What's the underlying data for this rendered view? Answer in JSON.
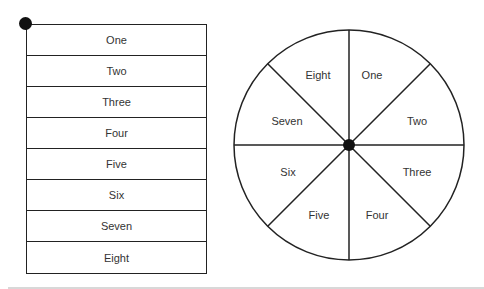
{
  "list": {
    "items": [
      "One",
      "Two",
      "Three",
      "Four",
      "Five",
      "Six",
      "Seven",
      "Eight"
    ]
  },
  "wheel": {
    "center": [
      349,
      145
    ],
    "radius": 115,
    "segments": [
      {
        "label": "One",
        "x": 372,
        "y": 79
      },
      {
        "label": "Two",
        "x": 417,
        "y": 125
      },
      {
        "label": "Three",
        "x": 417,
        "y": 176
      },
      {
        "label": "Four",
        "x": 377,
        "y": 219
      },
      {
        "label": "Five",
        "x": 319,
        "y": 219
      },
      {
        "label": "Six",
        "x": 288,
        "y": 176
      },
      {
        "label": "Seven",
        "x": 287,
        "y": 125
      },
      {
        "label": "Eight",
        "x": 318,
        "y": 79
      }
    ]
  },
  "colors": {
    "line": "#222222",
    "text": "#333333",
    "rule": "#d8d8d8"
  }
}
